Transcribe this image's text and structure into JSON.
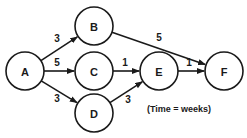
{
  "diagram": {
    "type": "activity-network",
    "node_radius": 19,
    "stroke_color": "#1a1a1a",
    "nodes": [
      {
        "id": "A",
        "label": "A",
        "x": 25,
        "y": 71
      },
      {
        "id": "B",
        "label": "B",
        "x": 94,
        "y": 26
      },
      {
        "id": "C",
        "label": "C",
        "x": 94,
        "y": 71
      },
      {
        "id": "D",
        "label": "D",
        "x": 94,
        "y": 113
      },
      {
        "id": "E",
        "label": "E",
        "x": 159,
        "y": 71
      },
      {
        "id": "F",
        "label": "F",
        "x": 224,
        "y": 71
      }
    ],
    "edges": [
      {
        "from": "A",
        "to": "B",
        "label": "3",
        "lx": 57,
        "ly": 42
      },
      {
        "from": "A",
        "to": "C",
        "label": "5",
        "lx": 57,
        "ly": 66
      },
      {
        "from": "A",
        "to": "D",
        "label": "3",
        "lx": 57,
        "ly": 102
      },
      {
        "from": "B",
        "to": "F",
        "label": "5",
        "lx": 159,
        "ly": 41
      },
      {
        "from": "C",
        "to": "E",
        "label": "1",
        "lx": 125,
        "ly": 66
      },
      {
        "from": "D",
        "to": "E",
        "label": "3",
        "lx": 128,
        "ly": 103
      },
      {
        "from": "E",
        "to": "F",
        "label": "1",
        "lx": 189,
        "ly": 66
      }
    ],
    "note": "(Time = weeks)"
  }
}
